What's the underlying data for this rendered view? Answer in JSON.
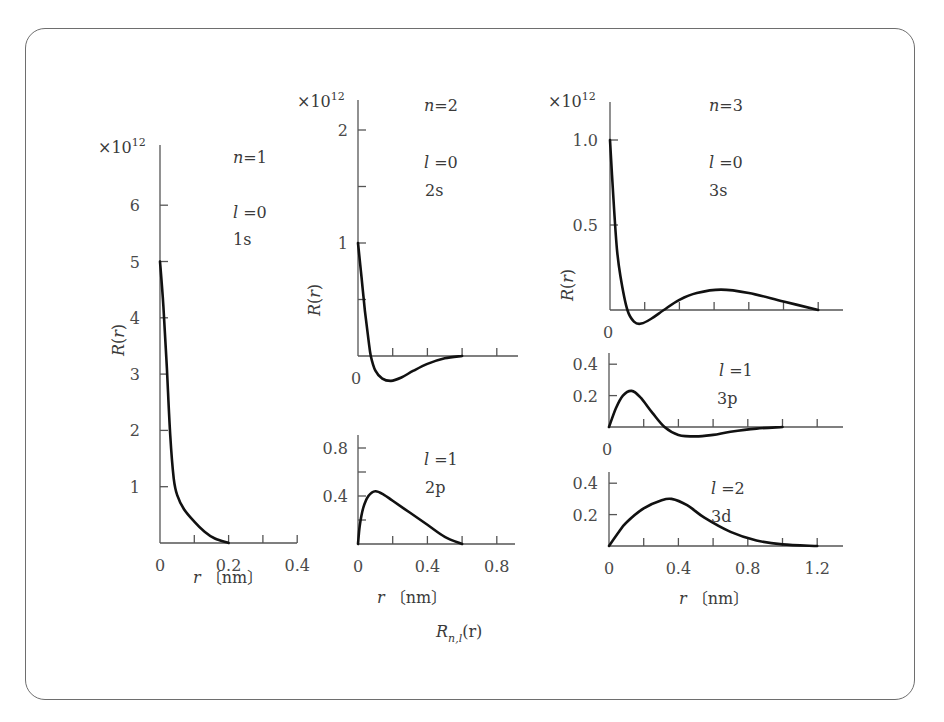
{
  "figure": {
    "bottom_label": "R_{n,l}(r)",
    "bottom_label_main": "R",
    "bottom_label_sub": "n,l",
    "bottom_label_arg": "(r)",
    "multiplier": "×10",
    "multiplier_exp": "12",
    "ylabel": "R(r)",
    "xlabel": "r〔nm〕"
  },
  "chart_data": [
    {
      "id": "1s",
      "type": "line",
      "title": "n=1",
      "n_label": "n=1",
      "l_label": "l =0",
      "orbital": "1s",
      "xlabel": "r〔nm〕",
      "ylabel": "R(r)",
      "y_multiplier": "×10^12",
      "xlim": [
        0,
        0.4
      ],
      "ylim": [
        0,
        7
      ],
      "x_ticks": [
        0,
        0.1,
        0.2,
        0.3,
        0.4
      ],
      "x_tick_labels": [
        "0",
        "0.2",
        "0.4"
      ],
      "y_ticks": [
        1,
        2,
        3,
        4,
        5,
        6
      ],
      "y_tick_labels": [
        "1",
        "2",
        "3",
        "4",
        "5",
        "6"
      ],
      "x": [
        0,
        0.01,
        0.02,
        0.03,
        0.04,
        0.05,
        0.07,
        0.1,
        0.13,
        0.16,
        0.2
      ],
      "y": [
        5.0,
        4.2,
        3.1,
        1.9,
        1.15,
        0.85,
        0.6,
        0.38,
        0.2,
        0.08,
        0.0
      ]
    },
    {
      "id": "2s",
      "type": "line",
      "title": "n=2",
      "n_label": "n=2",
      "l_label": "l =0",
      "orbital": "2s",
      "ylabel": "R(r)",
      "y_multiplier": "×10^12",
      "xlim": [
        0,
        0.8
      ],
      "ylim": [
        -0.3,
        2.2
      ],
      "x_ticks": [
        0,
        0.2,
        0.4,
        0.6,
        0.8
      ],
      "y_ticks": [
        0.5,
        1,
        1.5,
        2
      ],
      "y_tick_labels": [
        "0",
        "1",
        "2"
      ],
      "x": [
        0,
        0.02,
        0.04,
        0.06,
        0.074,
        0.1,
        0.14,
        0.19,
        0.25,
        0.32,
        0.4,
        0.5,
        0.6
      ],
      "y": [
        1.0,
        0.7,
        0.4,
        0.15,
        0.0,
        -0.13,
        -0.2,
        -0.22,
        -0.19,
        -0.13,
        -0.07,
        -0.02,
        0.0
      ]
    },
    {
      "id": "2p",
      "type": "line",
      "l_label": "l =1",
      "orbital": "2p",
      "xlabel": "r〔nm〕",
      "xlim": [
        0,
        0.9
      ],
      "ylim": [
        0,
        0.9
      ],
      "x_ticks": [
        0,
        0.2,
        0.4,
        0.6,
        0.8
      ],
      "x_tick_labels": [
        "0",
        "0.4",
        "0.8"
      ],
      "y_ticks": [
        0.2,
        0.4,
        0.6,
        0.8
      ],
      "y_tick_labels": [
        "0.4",
        "0.8"
      ],
      "x": [
        0,
        0.01,
        0.03,
        0.06,
        0.1,
        0.15,
        0.2,
        0.3,
        0.4,
        0.5,
        0.6
      ],
      "y": [
        0,
        0.15,
        0.3,
        0.4,
        0.44,
        0.41,
        0.36,
        0.26,
        0.16,
        0.06,
        0.0
      ]
    },
    {
      "id": "3s",
      "type": "line",
      "title": "n=3",
      "n_label": "n=3",
      "l_label": "l =0",
      "orbital": "3s",
      "ylabel": "R(r)",
      "y_multiplier": "×10^12",
      "xlim": [
        0,
        1.3
      ],
      "ylim": [
        -0.1,
        1.2
      ],
      "x_ticks": [
        0,
        0.2,
        0.4,
        0.6,
        0.8,
        1.0,
        1.2
      ],
      "y_ticks": [
        0.5,
        1.0
      ],
      "y_tick_labels": [
        "0",
        "0.5",
        "1.0"
      ],
      "x": [
        0,
        0.02,
        0.04,
        0.06,
        0.1,
        0.14,
        0.18,
        0.24,
        0.31,
        0.4,
        0.5,
        0.64,
        0.8,
        1.0,
        1.2
      ],
      "y": [
        1.0,
        0.65,
        0.36,
        0.2,
        0.0,
        -0.07,
        -0.08,
        -0.05,
        0.0,
        0.06,
        0.1,
        0.12,
        0.1,
        0.05,
        0.0
      ]
    },
    {
      "id": "3p",
      "type": "line",
      "l_label": "l =1",
      "orbital": "3p",
      "xlim": [
        0,
        1.3
      ],
      "ylim": [
        -0.1,
        0.45
      ],
      "x_ticks": [
        0,
        0.2,
        0.4,
        0.6,
        0.8,
        1.0,
        1.2
      ],
      "y_ticks": [
        0.2,
        0.4
      ],
      "y_tick_labels": [
        "0",
        "0.2",
        "0.4"
      ],
      "x": [
        0,
        0.04,
        0.08,
        0.13,
        0.18,
        0.25,
        0.32,
        0.4,
        0.5,
        0.6,
        0.7,
        0.85,
        1.0
      ],
      "y": [
        0,
        0.12,
        0.2,
        0.23,
        0.19,
        0.09,
        0.0,
        -0.05,
        -0.06,
        -0.05,
        -0.03,
        -0.01,
        0.0
      ]
    },
    {
      "id": "3d",
      "type": "line",
      "l_label": "l =2",
      "orbital": "3d",
      "xlabel": "r〔nm〕",
      "xlim": [
        0,
        1.3
      ],
      "ylim": [
        0,
        0.45
      ],
      "x_ticks": [
        0,
        0.2,
        0.4,
        0.6,
        0.8,
        1.0,
        1.2
      ],
      "x_tick_labels": [
        "0",
        "0.4",
        "0.8",
        "1.2"
      ],
      "y_ticks": [
        0.2,
        0.4
      ],
      "y_tick_labels": [
        "0.2",
        "0.4"
      ],
      "x": [
        0,
        0.05,
        0.1,
        0.2,
        0.3,
        0.36,
        0.45,
        0.55,
        0.7,
        0.85,
        1.0,
        1.2
      ],
      "y": [
        0,
        0.08,
        0.15,
        0.24,
        0.29,
        0.3,
        0.26,
        0.18,
        0.09,
        0.035,
        0.01,
        0.0
      ]
    }
  ]
}
